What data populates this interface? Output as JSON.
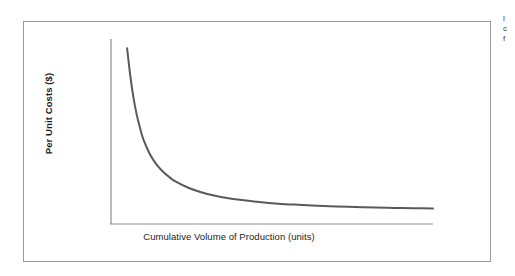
{
  "figure": {
    "frame_border_color": "#9a9a9a",
    "background_color": "#ffffff",
    "axis_color": "#8c8c8c",
    "curve_color": "#5a5a5a"
  },
  "axes": {
    "y_title": "Per Unit Costs ($)",
    "x_title": "Cumulative Volume of Production (units)"
  },
  "caption_sliver": {
    "line1": "l",
    "line2": "c",
    "line3": "f"
  },
  "chart_data": {
    "type": "line",
    "title": "",
    "subtitle": "",
    "xlabel": "Cumulative Volume of Production (units)",
    "ylabel": "Per Unit Costs ($)",
    "grid": false,
    "legend": false,
    "legend_position": "none",
    "xlim": [
      0,
      100
    ],
    "ylim": [
      0,
      100
    ],
    "x_tick_labels": [],
    "y_tick_labels": [],
    "annotations": [],
    "series": [
      {
        "name": "Unit cost experience curve",
        "color": "#5a5a5a",
        "line_width": 2,
        "x": [
          5,
          6,
          7,
          8,
          9,
          10,
          12,
          14,
          16,
          18,
          20,
          24,
          28,
          32,
          36,
          40,
          46,
          52,
          58,
          64,
          70,
          76,
          82,
          88,
          94,
          100
        ],
        "y": [
          95,
          80,
          68,
          59,
          52,
          46,
          38,
          32.5,
          28.5,
          25.5,
          23,
          19.6,
          17.2,
          15.4,
          14.1,
          13.1,
          11.9,
          11.0,
          10.4,
          9.9,
          9.5,
          9.2,
          8.9,
          8.7,
          8.5,
          8.4
        ]
      }
    ]
  }
}
